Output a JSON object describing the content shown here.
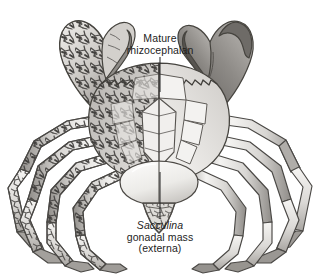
{
  "figure": {
    "name": "crab-parasitized-by-sacculina",
    "medium": "grayscale pen-and-ink scientific illustration",
    "background_color": "#ffffff",
    "width": 319,
    "height": 275
  },
  "labels": {
    "mature_rhizocephalan": {
      "line1": "Mature",
      "line2": "rhizocephalan"
    },
    "sacculina": {
      "line1": "Sacculina",
      "line2": "gonadal mass",
      "line3": "(externa)"
    }
  },
  "palette": {
    "text": "#1d1d1d",
    "leader_line": "#2b2b2b",
    "outline": "#3a3a3a",
    "shell_light": "#f2f1ef",
    "shell_mid": "#d6d4d1",
    "shell_dark": "#9b9894",
    "shell_shadow": "#6e6b68",
    "root_dark": "#454341",
    "externa_light": "#f6f5f3",
    "externa_shade": "#cdcbc7",
    "background": "#ffffff"
  },
  "anatomy": {
    "parts": [
      {
        "name": "left-cheliped",
        "side": "left",
        "infested": true
      },
      {
        "name": "right-cheliped",
        "side": "right",
        "infested": false
      },
      {
        "name": "carapace",
        "side": "both",
        "infested": true
      },
      {
        "name": "left-walking-legs",
        "side": "left",
        "infested": true
      },
      {
        "name": "right-walking-legs",
        "side": "right",
        "infested": false
      },
      {
        "name": "abdomen",
        "side": "both",
        "infested": false
      },
      {
        "name": "externa-gonadal-mass",
        "side": "ventral",
        "infested": true
      }
    ],
    "note": "Left half of the animal is pervaded by dark branching rootlets (interna); right half is drawn clean for contrast."
  }
}
